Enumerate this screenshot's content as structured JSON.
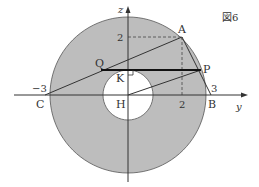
{
  "figure": {
    "title": "図6",
    "colors": {
      "ring_fill": "#bdbdbd",
      "ring_stroke": "#555555",
      "line": "#333333",
      "bold_line": "#111111",
      "background": "#ffffff"
    },
    "axes": {
      "horizontal_label": "y",
      "vertical_label": "z"
    },
    "ticks": {
      "z_2": "2",
      "y_2": "2",
      "y_3": "3",
      "y_neg3": "−3"
    },
    "points": {
      "A": "A",
      "P": "P",
      "Q": "Q",
      "K": "K",
      "H": "H",
      "C": "C",
      "B": "B"
    },
    "geometry": {
      "origin_H": [
        0,
        0
      ],
      "A": [
        2,
        2
      ],
      "B": [
        3,
        0
      ],
      "C": [
        -3,
        0
      ],
      "outer_radius_label": "3",
      "segments": [
        "C–A",
        "A–B",
        "H–P",
        "Q–P (bold)",
        "dashed z=2 to A",
        "dashed A to y=2"
      ],
      "right_angle_at": "K"
    }
  }
}
